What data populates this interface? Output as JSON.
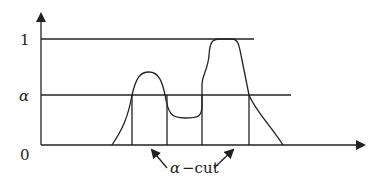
{
  "diagram": {
    "y_axis_labels": [
      {
        "text": "1",
        "y": 39
      },
      {
        "text": "α",
        "y": 95
      },
      {
        "text": "0",
        "y": 145
      }
    ],
    "annotation": {
      "alpha": "α",
      "text": "−cut"
    },
    "levels": {
      "one": "1",
      "alpha": "α",
      "zero": "0"
    },
    "colors": {
      "stroke": "#222222",
      "background": "#ffffff"
    }
  }
}
